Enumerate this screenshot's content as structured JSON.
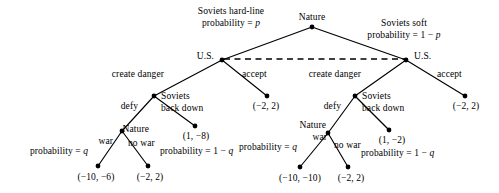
{
  "diagram": {
    "nodes": {
      "root": {
        "label": "Nature",
        "x": 312,
        "y": 27,
        "type": "chance"
      },
      "us_left": {
        "label": "U.S.",
        "x": 222,
        "y": 60,
        "type": "decision"
      },
      "us_right": {
        "label": "U.S.",
        "x": 406,
        "y": 60,
        "type": "decision"
      },
      "soviets_left": {
        "label": "Soviets",
        "x": 154,
        "y": 96,
        "type": "decision"
      },
      "soviets_right": {
        "label": "Soviets",
        "x": 355,
        "y": 96,
        "type": "decision"
      },
      "nature_left": {
        "label": "Nature",
        "x": 122,
        "y": 131,
        "type": "chance"
      },
      "nature_right": {
        "label": "Nature",
        "x": 328,
        "y": 133,
        "type": "chance"
      }
    },
    "chance_branches": {
      "hard_line": {
        "line1": "Soviets hard-line",
        "line2": "probability = p"
      },
      "soft": {
        "line1": "Soviets soft",
        "line2": "probability = 1 − p"
      }
    },
    "us_actions": {
      "left_create_danger": "create danger",
      "left_accept": "accept",
      "right_create_danger": "create danger",
      "right_accept": "accept"
    },
    "soviet_actions": {
      "left_defy": "defy",
      "left_back_down_line1": "Soviets",
      "left_back_down_line2": "back down",
      "right_defy": "defy",
      "right_back_down_line1": "Soviets",
      "right_back_down_line2": "back down"
    },
    "nature_actions": {
      "left_war": "war",
      "left_war_prob": "probability = q",
      "left_no_war": "no war",
      "left_no_war_prob": "probability = 1 − q",
      "right_war": "war",
      "right_war_prob": "probability = q",
      "right_no_war": "no war",
      "right_no_war_prob": "probability = 1 − q"
    },
    "payoffs": {
      "left_accept": {
        "text": "(−2, 2)",
        "x": 267,
        "y": 96
      },
      "right_accept": {
        "text": "(−2, 2)",
        "x": 465,
        "y": 96
      },
      "left_back_down": {
        "text": "(1, −8)",
        "x": 195,
        "y": 126
      },
      "right_back_down": {
        "text": "(1, −2)",
        "x": 389,
        "y": 130
      },
      "left_war": {
        "text": "(−10, −6)",
        "x": 98,
        "y": 166
      },
      "left_no_war": {
        "text": "(−2, 2)",
        "x": 148,
        "y": 166
      },
      "right_war": {
        "text": "(−10, −10)",
        "x": 300,
        "y": 167
      },
      "right_no_war": {
        "text": "(−2, 2)",
        "x": 348,
        "y": 167
      }
    },
    "information_set": {
      "label": "U.S. information set (dashed link)",
      "from_x": 222,
      "from_y": 60,
      "to_x": 406,
      "to_y": 60
    },
    "colors": {
      "ink": "#000000",
      "background": "#ffffff"
    }
  }
}
